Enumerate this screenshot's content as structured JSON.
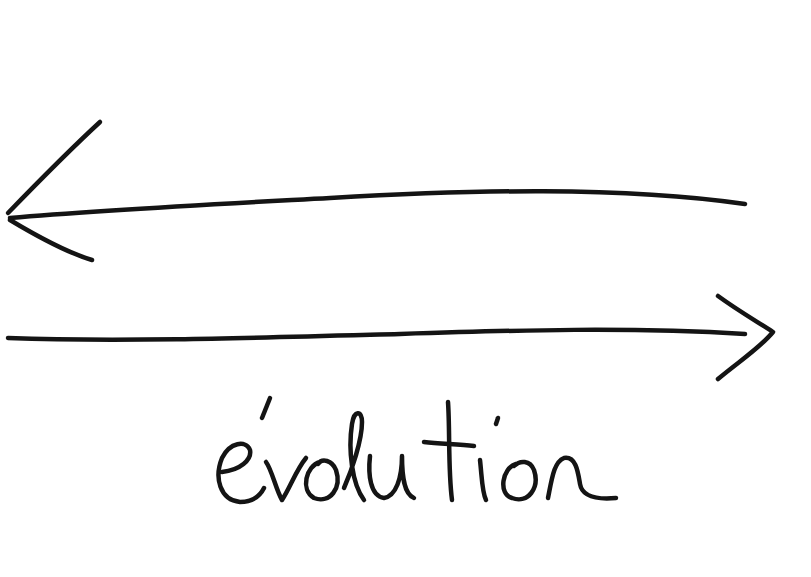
{
  "diagram": {
    "type": "hand-drawn sketch",
    "stroke_color": "#141414",
    "background": "#ffffff",
    "arrows": [
      {
        "id": "top-arrow",
        "direction": "left",
        "from": [
          745,
          204
        ],
        "to": [
          8,
          218
        ]
      },
      {
        "id": "bottom-arrow",
        "direction": "right",
        "from": [
          8,
          338
        ],
        "to": [
          772,
          332
        ]
      }
    ],
    "label": "évolution"
  }
}
